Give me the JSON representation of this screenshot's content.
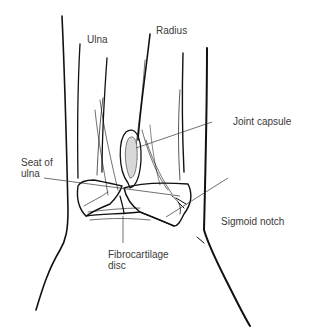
{
  "diagram": {
    "labels": {
      "ulna": "Ulna",
      "radius": "Radius",
      "joint_capsule": "Joint capsule",
      "seat_of_ulna_line1": "Seat of",
      "seat_of_ulna_line2": "ulna",
      "sigmoid_notch": "Sigmoid notch",
      "fibrocartilage_disc_line1": "Fibrocartilage",
      "fibrocartilage_disc_line2": "disc"
    },
    "colors": {
      "background": "#ffffff",
      "ink": "#111111",
      "label_text": "#3a3a3a",
      "leader_line": "#333333"
    }
  }
}
